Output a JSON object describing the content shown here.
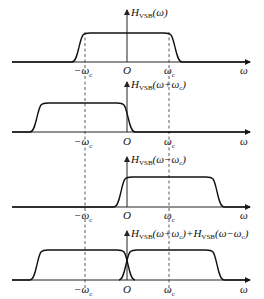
{
  "diagram": {
    "panels": [
      {
        "id": "p1",
        "function_label": "H_VSB(ω)",
        "func_main": "H",
        "func_sub": "VSB",
        "func_arg": "(ω)",
        "ticks": {
          "neg_wc": "−ω",
          "neg_wc_sub": "c",
          "origin": "O",
          "wc": "ω",
          "wc_sub": "c",
          "axis": "ω"
        }
      },
      {
        "id": "p2",
        "function_label": "H_VSB(ω+ω_c)",
        "func_main": "H",
        "func_sub": "VSB",
        "func_arg": "(ω+ω",
        "func_arg_sub": "c",
        "func_arg_end": ")",
        "ticks": {
          "neg_wc": "−ω",
          "neg_wc_sub": "c",
          "origin": "O",
          "wc": "ω",
          "wc_sub": "c",
          "axis": "ω"
        }
      },
      {
        "id": "p3",
        "function_label": "H_VSB(ω−ω_c)",
        "func_main": "H",
        "func_sub": "VSB",
        "func_arg": "(ω−ω",
        "func_arg_sub": "c",
        "func_arg_end": ")",
        "ticks": {
          "neg_wc": "−ω",
          "neg_wc_sub": "c",
          "origin": "O",
          "wc": "ω",
          "wc_sub": "c",
          "axis": "ω"
        }
      },
      {
        "id": "p4",
        "function_label": "H_VSB(ω+ω_c)+H_VSB(ω−ω_c)",
        "func_main": "H",
        "func_sub": "VSB",
        "func_arg": "(ω+ω",
        "func_arg_sub": "c",
        "func_arg_mid": ")+H",
        "func_sub2": "VSB",
        "func_arg2": "(ω−ω",
        "func_arg2_sub": "c",
        "func_arg_end": ")",
        "ticks": {
          "neg_wc": "−ω",
          "neg_wc_sub": "c",
          "origin": "O",
          "wc": "ω",
          "wc_sub": "c",
          "axis": "ω"
        }
      }
    ],
    "colors": {
      "line": "#111111",
      "background": "#ffffff"
    }
  }
}
